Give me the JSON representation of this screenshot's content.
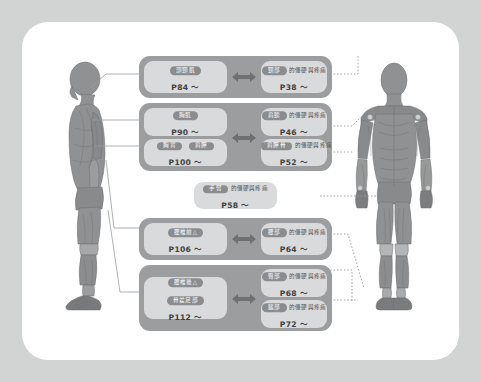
{
  "diagram": {
    "colors": {
      "outer_background": "#d2d4d4",
      "panel_background": "#ffffff",
      "group_background": "#9b9d9e",
      "card_background": "#d9dadb",
      "badge_background": "#8a8c8d",
      "badge_text": "#ffffff",
      "body_text": "#4e5051",
      "page_text": "#3e4041",
      "arrow": "#6e7071",
      "figure_fill": "#8f9192",
      "leader_line": "#9b9d9e"
    },
    "suffix_text": "的僵硬與疼痛",
    "page_prefix": "P",
    "page_suffix": "～"
  },
  "figures": [
    {
      "name": "lateral-view-muscle-figure",
      "orientation": "side"
    },
    {
      "name": "anterior-view-muscle-figure",
      "orientation": "front"
    }
  ],
  "groups": [
    {
      "id": "group-neck",
      "cards": [
        {
          "side": "left",
          "badges": [
            "頭頸肌"
          ],
          "suffix": "",
          "page": "P84 ～"
        },
        {
          "side": "right",
          "badges": [
            "頸部"
          ],
          "suffix": "的僵硬與疼痛",
          "page": "P38 ～"
        }
      ],
      "arrow": true
    },
    {
      "id": "group-shoulder",
      "cards": [
        {
          "side": "left",
          "badges": [
            "胸肌"
          ],
          "suffix": "",
          "page": "P90 ～"
        },
        {
          "side": "right",
          "badges": [
            "肩膀"
          ],
          "suffix": "的僵硬與疼痛",
          "page": "P46 ～"
        },
        {
          "side": "left",
          "badges": [
            "胸背",
            "肩胛"
          ],
          "suffix": "",
          "page": "P100 ～"
        },
        {
          "side": "right",
          "badges": [
            "肩胛骨"
          ],
          "suffix": "的僵硬與疼痛",
          "page": "P52 ～"
        }
      ],
      "arrow": true
    },
    {
      "id": "group-arm",
      "cards": [
        {
          "side": "single",
          "badges": [
            "手臂"
          ],
          "suffix": "的僵硬與疼痛",
          "page": "P58 ～"
        }
      ],
      "arrow": false
    },
    {
      "id": "group-lumbar",
      "cards": [
        {
          "side": "left",
          "badges": [
            "腰椎前△"
          ],
          "suffix": "",
          "page": "P106 ～"
        },
        {
          "side": "right",
          "badges": [
            "腰部"
          ],
          "suffix": "的僵硬與疼痛",
          "page": "P64 ～"
        }
      ],
      "arrow": true
    },
    {
      "id": "group-hip-leg",
      "cards": [
        {
          "side": "left",
          "badges": [
            "腰椎後△",
            "骨盆足部"
          ],
          "suffix": "",
          "page": "P112 ～"
        },
        {
          "side": "right",
          "badges": [
            "臀部"
          ],
          "suffix": "的僵硬與疼痛",
          "page": "P68 ～"
        },
        {
          "side": "right",
          "badges": [
            "腿部"
          ],
          "suffix": "的僵硬與疼痛",
          "page": "P72 ～"
        }
      ],
      "arrow": true
    }
  ]
}
